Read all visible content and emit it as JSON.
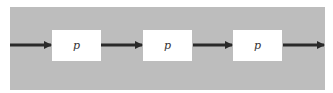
{
  "diagram": {
    "background_color": "#bdbdbd",
    "box_color": "#ffffff",
    "arrow_color": "#2a2a2a",
    "nodes": [
      {
        "id": "p1",
        "label": "p"
      },
      {
        "id": "p2",
        "label": "p"
      },
      {
        "id": "p3",
        "label": "p"
      }
    ],
    "edges": [
      {
        "from": "input",
        "to": "p1"
      },
      {
        "from": "p1",
        "to": "p2"
      },
      {
        "from": "p2",
        "to": "p3"
      },
      {
        "from": "p3",
        "to": "output"
      }
    ]
  }
}
